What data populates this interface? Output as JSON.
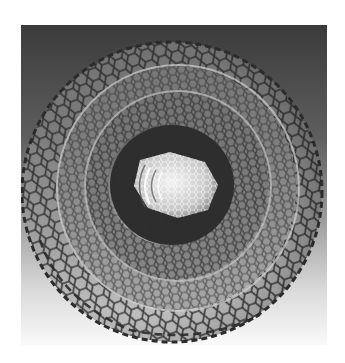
{
  "image": {
    "subject": "multi-walled carbon nanotube",
    "style": "grayscale illustration",
    "canvas": {
      "width": 345,
      "height": 363,
      "background": "#ffffff"
    },
    "panel": {
      "x": 21,
      "y": 25,
      "width": 306,
      "height": 320
    },
    "colors": {
      "panel_top": "#3a3a3a",
      "panel_mid": "#8a8a8a",
      "panel_bottom": "#f4f4f4",
      "lattice_line": "#2a2a2a",
      "inner_tube": "#e8e8e8",
      "cavity": "#2e2e2e"
    },
    "walls": [
      {
        "name": "outer-wall",
        "cx": 178,
        "cy": 190,
        "rx": 148,
        "ry": 150
      },
      {
        "name": "wall-2",
        "cx": 178,
        "cy": 188,
        "rx": 118,
        "ry": 120
      },
      {
        "name": "wall-3",
        "cx": 176,
        "cy": 186,
        "rx": 92,
        "ry": 94
      },
      {
        "name": "cavity",
        "cx": 170,
        "cy": 185,
        "rx": 62,
        "ry": 60
      },
      {
        "name": "inner-tube",
        "cx": 166,
        "cy": 183,
        "rx": 40,
        "ry": 38
      }
    ]
  }
}
